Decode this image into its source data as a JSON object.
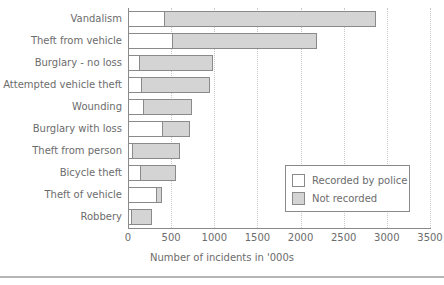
{
  "chart_data": {
    "type": "bar",
    "orientation": "horizontal",
    "stacked": true,
    "title": "",
    "xlabel": "Number of incidents in '000s",
    "ylabel": "",
    "xlim": [
      0,
      3500
    ],
    "xticks": [
      0,
      500,
      1000,
      1500,
      2000,
      2500,
      3000,
      3500
    ],
    "xtick_labels": [
      "0",
      "500",
      "1000",
      "1500",
      "2000",
      "2500",
      "3000",
      "3500"
    ],
    "grid": "vertical-dotted",
    "legend_position": "lower-right",
    "categories": [
      "Vandalism",
      "Theft from vehicle",
      "Burglary - no loss",
      "Attempted vehicle theft",
      "Wounding",
      "Burglary with loss",
      "Theft from person",
      "Bicycle theft",
      "Theft of vehicle",
      "Robbery"
    ],
    "series": [
      {
        "name": "Recorded by police",
        "color": "#ffffff",
        "values": [
          430,
          520,
          140,
          160,
          190,
          400,
          60,
          150,
          340,
          45
        ]
      },
      {
        "name": "Not recorded",
        "color": "#d4d4d4",
        "values": [
          2450,
          1670,
          845,
          790,
          550,
          315,
          545,
          405,
          55,
          235
        ]
      }
    ],
    "totals": [
      2880,
      2190,
      985,
      950,
      740,
      715,
      605,
      555,
      395,
      280
    ]
  },
  "legend": {
    "items": [
      {
        "label": "Recorded by police",
        "swatch": "recorded"
      },
      {
        "label": "Not recorded",
        "swatch": "notrecorded"
      }
    ]
  },
  "colors": {
    "recorded_fill": "#ffffff",
    "not_recorded_fill": "#d4d4d4",
    "bar_border": "#8a8a8a",
    "gridline": "#c8c8c8",
    "text": "#6c6c6c",
    "axis": "#8a8a8a",
    "background": "#ffffff"
  }
}
